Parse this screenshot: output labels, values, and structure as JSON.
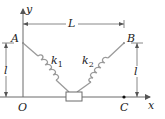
{
  "diagram": {
    "type": "spring-mass system",
    "colors": {
      "line": "#6b6b6b",
      "spring": "#9a9a9a",
      "text": "#222222",
      "block_fill": "#ffffff"
    },
    "axes": {
      "x_label": "x",
      "y_label": "y",
      "origin_label": "O"
    },
    "points": {
      "A": "A",
      "B": "B",
      "C": "C"
    },
    "dimensions": {
      "horizontal": "L",
      "left_height": "l",
      "right_height": "l"
    },
    "springs": [
      {
        "name": "k",
        "subscript": "1"
      },
      {
        "name": "k",
        "subscript": "2"
      }
    ]
  }
}
